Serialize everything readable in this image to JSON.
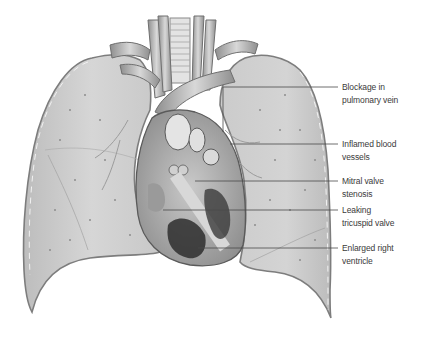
{
  "figure": {
    "colors": {
      "background": "#ffffff",
      "lung_fill": "#cfcfcf",
      "lung_edge": "#8a8a8a",
      "heart_fill": "#b8b8b8",
      "dark_tissue": "#2e2e2e",
      "leader_line": "#4a4a4a",
      "label_text": "#3a3a3a"
    }
  },
  "labels": [
    {
      "id": "blockage",
      "line1": "Blockage in",
      "line2": "pulmonary vein",
      "y": 87
    },
    {
      "id": "inflamed",
      "line1": "Inflamed blood",
      "line2": "vessels",
      "y": 144
    },
    {
      "id": "mitral",
      "line1": "Mitral valve",
      "line2": "stenosis",
      "y": 181
    },
    {
      "id": "tricuspid",
      "line1": "Leaking",
      "line2": "tricuspid valve",
      "y": 210
    },
    {
      "id": "ventricle",
      "line1": "Enlarged right",
      "line2": "ventricle",
      "y": 248
    }
  ]
}
